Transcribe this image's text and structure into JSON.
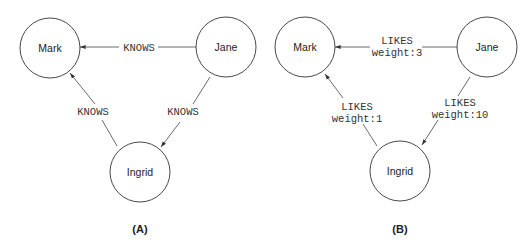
{
  "diagrams": [
    {
      "caption": "(A)",
      "nodes": [
        {
          "id": "mark",
          "label": "Mark"
        },
        {
          "id": "jane",
          "label": "Jane"
        },
        {
          "id": "ingrid",
          "label": "Ingrid"
        }
      ],
      "edges": [
        {
          "from": "Jane",
          "to": "Mark",
          "label": "KNOWS"
        },
        {
          "from": "Jane",
          "to": "Ingrid",
          "label": "KNOWS"
        },
        {
          "from": "Ingrid",
          "to": "Mark",
          "label": "KNOWS"
        }
      ]
    },
    {
      "caption": "(B)",
      "nodes": [
        {
          "id": "mark",
          "label": "Mark"
        },
        {
          "id": "jane",
          "label": "Jane"
        },
        {
          "id": "ingrid",
          "label": "Ingrid"
        }
      ],
      "edges": [
        {
          "from": "Jane",
          "to": "Mark",
          "label": "LIKES",
          "property": "weight:3"
        },
        {
          "from": "Jane",
          "to": "Ingrid",
          "label": "LIKES",
          "property": "weight:10"
        },
        {
          "from": "Ingrid",
          "to": "Mark",
          "label": "LIKES",
          "property": "weight:1"
        }
      ]
    }
  ]
}
